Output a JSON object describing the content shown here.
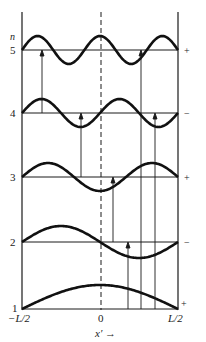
{
  "diagram": {
    "y_axis_label": "n",
    "x_axis_label": "x′ →",
    "x_ticks": [
      "−L/2",
      "0",
      "L/2"
    ],
    "levels": [
      {
        "n": "5",
        "sign": "+"
      },
      {
        "n": "4",
        "sign": "−"
      },
      {
        "n": "3",
        "sign": "+"
      },
      {
        "n": "2",
        "sign": "−"
      },
      {
        "n": "1",
        "sign": "+"
      }
    ],
    "colors": {
      "line": "#1a1a1a",
      "background": "#ffffff"
    }
  }
}
